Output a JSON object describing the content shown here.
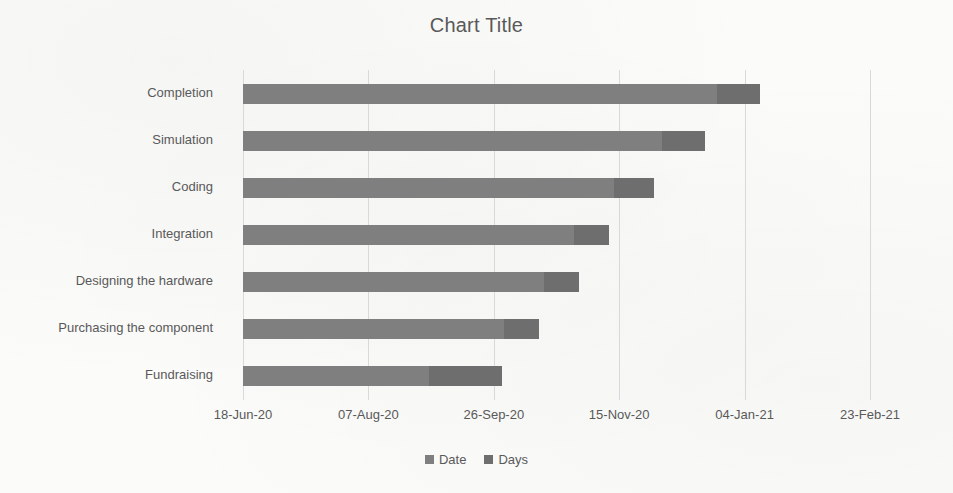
{
  "chart_data": {
    "type": "bar",
    "subtype": "stacked-horizontal-gantt",
    "title": "Chart Title",
    "xlabel": "",
    "ylabel": "",
    "orientation": "horizontal",
    "stacked": true,
    "grid": true,
    "legend_position": "bottom",
    "categories": [
      "Fundraising",
      "Purchasing the component",
      "Designing the hardware",
      "Integration",
      "Coding",
      "Simulation",
      "Completion"
    ],
    "categories_top_to_bottom": [
      "Completion",
      "Simulation",
      "Coding",
      "Integration",
      "Designing the hardware",
      "Purchasing the component",
      "Fundraising"
    ],
    "series": [
      {
        "name": "Date",
        "color": "#7f7f7f",
        "values": [
          74,
          104,
          120,
          132,
          148,
          167,
          189
        ]
      },
      {
        "name": "Days",
        "color": "#6e6e6e",
        "values": [
          29,
          14,
          14,
          14,
          16,
          17,
          17
        ]
      }
    ],
    "x_tick_labels": [
      "18-Jun-20",
      "07-Aug-20",
      "26-Sep-20",
      "15-Nov-20",
      "04-Jan-21",
      "23-Feb-21"
    ],
    "x_tick_values": [
      0,
      50,
      100,
      150,
      200,
      250
    ],
    "xlim": [
      0,
      250
    ],
    "x_units": "days since 18-Jun-20",
    "bars_top_to_bottom": [
      {
        "category": "Completion",
        "date": 189,
        "days": 17
      },
      {
        "category": "Simulation",
        "date": 167,
        "days": 17
      },
      {
        "category": "Coding",
        "date": 148,
        "days": 16
      },
      {
        "category": "Integration",
        "date": 132,
        "days": 14
      },
      {
        "category": "Designing the hardware",
        "date": 120,
        "days": 14
      },
      {
        "category": "Purchasing the component",
        "date": 104,
        "days": 14
      },
      {
        "category": "Fundraising",
        "date": 74,
        "days": 29
      }
    ]
  },
  "legend": {
    "items": [
      {
        "label": "Date",
        "color": "#7f7f7f"
      },
      {
        "label": "Days",
        "color": "#6e6e6e"
      }
    ]
  },
  "colors": {
    "series_date": "#7f7f7f",
    "series_days": "#6e6e6e",
    "gridline": "#d9d9d9",
    "axis": "#bfbfbf",
    "text": "#595959",
    "background": "#fbfbfa"
  }
}
